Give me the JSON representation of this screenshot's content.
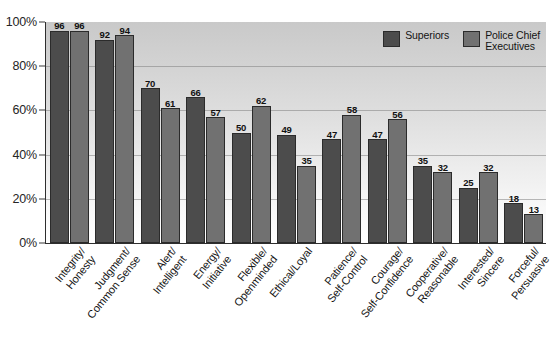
{
  "chart_data": {
    "type": "bar",
    "title": "",
    "subtitle": "",
    "xlabel": "",
    "ylabel": "",
    "ylim": [
      0,
      100
    ],
    "y_ticks": [
      "0%",
      "20%",
      "40%",
      "60%",
      "80%",
      "100%"
    ],
    "y_tick_values": [
      0,
      20,
      40,
      60,
      80,
      100
    ],
    "grid": true,
    "legend_position": "top-right-inside",
    "categories": [
      "Integrity/\nHonesty",
      "Judgment/\nCommon Sense",
      "Alert/\nIntelligent",
      "Energy/\nInitiative",
      "Flexible/\nOpenminded",
      "Ethical/Loyal",
      "Patience/\nSelf-Control",
      "Courage/\nSelf-Confidence",
      "Cooperative/\nReasonable",
      "Interested/\nSincere",
      "Forceful/\nPersuasive"
    ],
    "series": [
      {
        "name": "Superiors",
        "color": "#4c4c4c",
        "values": [
          96,
          92,
          70,
          66,
          50,
          49,
          47,
          47,
          35,
          25,
          18
        ]
      },
      {
        "name": "Police Chief\nExecutives",
        "color": "#717171",
        "values": [
          96,
          94,
          61,
          57,
          62,
          35,
          58,
          56,
          32,
          32,
          13
        ]
      }
    ]
  },
  "legend": {
    "items": [
      {
        "label": "Superiors",
        "color": "#4c4c4c"
      },
      {
        "label": "Police Chief\nExecutives",
        "color": "#717171"
      }
    ]
  }
}
